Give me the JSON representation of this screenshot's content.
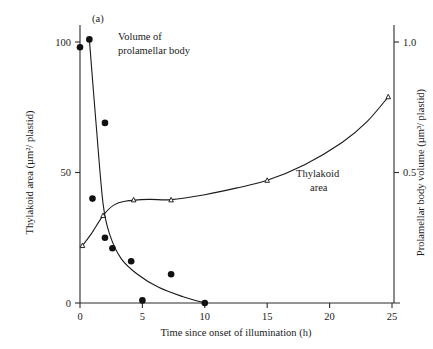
{
  "figure": {
    "panel_label": "(a)",
    "background": "#ffffff",
    "ink_color": "#1a1a1a"
  },
  "annotations": {
    "series1_label_line1": "Volume of",
    "series1_label_line2": "prolamellar body",
    "series2_label_line1": "Thylakoid",
    "series2_label_line2": "area"
  },
  "chart_data": {
    "type": "scatter",
    "title": "(a)",
    "xlabel": "Time since onset of illumination (h)",
    "ylabel": "Thylakoid area (µm²/ plastid)",
    "y2label": "Prolamellar body volume (µm³/ plastid)",
    "xlim": [
      0,
      26
    ],
    "ylim": [
      0,
      110
    ],
    "y2lim": [
      0,
      1.1
    ],
    "xticks": [
      0,
      5,
      10,
      15,
      20,
      25
    ],
    "xticklabels": [
      "0",
      "5",
      "10",
      "15",
      "20",
      "25"
    ],
    "yticks": [
      0,
      50,
      100
    ],
    "yticklabels": [
      "0",
      "50",
      "100"
    ],
    "y2ticks": [
      0.5,
      1.0
    ],
    "y2ticklabels": [
      "0.5",
      "1.0"
    ],
    "grid": false,
    "legend": "inline-annotations",
    "series": [
      {
        "name": "Volume of prolamellar body",
        "marker": "filled-circle",
        "axis": "right",
        "units": "µm³/ plastid",
        "points": [
          {
            "x": 0.0,
            "y": 0.98
          },
          {
            "x": 0.75,
            "y": 1.01
          },
          {
            "x": 2.0,
            "y": 0.69
          },
          {
            "x": 1.0,
            "y": 0.4
          },
          {
            "x": 2.0,
            "y": 0.25
          },
          {
            "x": 2.6,
            "y": 0.21
          },
          {
            "x": 4.1,
            "y": 0.16
          },
          {
            "x": 7.3,
            "y": 0.11
          },
          {
            "x": 5.0,
            "y": 0.01
          },
          {
            "x": 10.0,
            "y": 0.0
          }
        ],
        "curve": [
          {
            "x": 0.75,
            "y": 1.01
          },
          {
            "x": 1.3,
            "y": 0.68
          },
          {
            "x": 1.85,
            "y": 0.38
          },
          {
            "x": 2.4,
            "y": 0.26
          },
          {
            "x": 3.3,
            "y": 0.17
          },
          {
            "x": 4.6,
            "y": 0.11
          },
          {
            "x": 6.3,
            "y": 0.06
          },
          {
            "x": 8.2,
            "y": 0.025
          },
          {
            "x": 10.0,
            "y": 0.0
          }
        ]
      },
      {
        "name": "Thylakoid area",
        "marker": "open-triangle",
        "axis": "left",
        "units": "µm²/ plastid",
        "points": [
          {
            "x": 0.2,
            "y": 22.0
          },
          {
            "x": 1.85,
            "y": 33.5
          },
          {
            "x": 4.3,
            "y": 39.5
          },
          {
            "x": 7.3,
            "y": 39.5
          },
          {
            "x": 15.0,
            "y": 47.0
          },
          {
            "x": 24.7,
            "y": 79.0
          }
        ],
        "curve": [
          {
            "x": 0.2,
            "y": 22.0
          },
          {
            "x": 0.9,
            "y": 26.5
          },
          {
            "x": 1.85,
            "y": 33.5
          },
          {
            "x": 2.7,
            "y": 37.5
          },
          {
            "x": 3.6,
            "y": 39.0
          },
          {
            "x": 5.5,
            "y": 39.7
          },
          {
            "x": 7.3,
            "y": 39.6
          },
          {
            "x": 10.0,
            "y": 41.5
          },
          {
            "x": 12.5,
            "y": 44.0
          },
          {
            "x": 15.0,
            "y": 47.0
          },
          {
            "x": 18.0,
            "y": 53.0
          },
          {
            "x": 21.0,
            "y": 61.5
          },
          {
            "x": 23.0,
            "y": 69.5
          },
          {
            "x": 24.7,
            "y": 79.0
          }
        ]
      }
    ]
  }
}
